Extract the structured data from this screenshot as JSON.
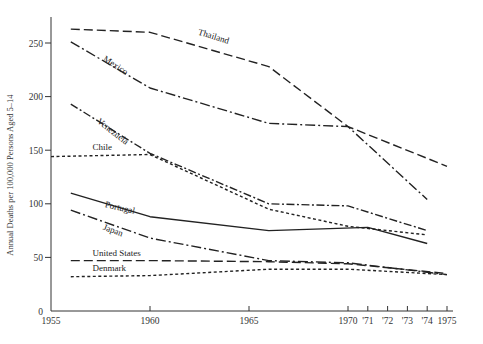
{
  "chart_data": {
    "type": "line",
    "title": "",
    "xlabel": "",
    "ylabel": "Annual Deaths per 100,000 Persons Aged 5–14",
    "xlim": [
      1955,
      1975
    ],
    "ylim": [
      0,
      270
    ],
    "grid": false,
    "legend": "inline labels",
    "x_ticks": [
      {
        "value": 1955,
        "label": "1955"
      },
      {
        "value": 1960,
        "label": "1960"
      },
      {
        "value": 1965,
        "label": "1965"
      },
      {
        "value": 1970,
        "label": "1970"
      },
      {
        "value": 1971,
        "label": "'71"
      },
      {
        "value": 1972,
        "label": "'72"
      },
      {
        "value": 1973,
        "label": "'73"
      },
      {
        "value": 1974,
        "label": "'74"
      },
      {
        "value": 1975,
        "label": "1975"
      }
    ],
    "y_ticks": [
      {
        "value": 0,
        "label": "0"
      },
      {
        "value": 50,
        "label": "50"
      },
      {
        "value": 100,
        "label": "100"
      },
      {
        "value": 150,
        "label": "150"
      },
      {
        "value": 200,
        "label": "200"
      },
      {
        "value": 250,
        "label": "250"
      }
    ],
    "series": [
      {
        "name": "Thailand",
        "style": "long-dash",
        "x": [
          1956,
          1960,
          1966,
          1970,
          1975
        ],
        "values": [
          263,
          260,
          228,
          172,
          135
        ],
        "label_pos": {
          "x": 1962.4,
          "y": 258,
          "angle": 17
        }
      },
      {
        "name": "Mexico",
        "style": "dash-dot",
        "x": [
          1956,
          1960,
          1966,
          1970,
          1974
        ],
        "values": [
          251,
          208,
          175,
          172,
          104
        ],
        "label_pos": {
          "x": 1957.6,
          "y": 234,
          "angle": 33
        }
      },
      {
        "name": "Venezuela",
        "style": "dash-dot-dense",
        "x": [
          1956,
          1960,
          1966,
          1970,
          1974
        ],
        "values": [
          193,
          147,
          100,
          98,
          75
        ],
        "label_pos": {
          "x": 1957.3,
          "y": 176,
          "angle": 38
        }
      },
      {
        "name": "Chile",
        "style": "short-dash",
        "x": [
          1955,
          1960,
          1966,
          1970,
          1974
        ],
        "values": [
          144,
          146,
          95,
          79,
          71
        ],
        "label_pos": {
          "x": 1957.1,
          "y": 150,
          "angle": 0
        }
      },
      {
        "name": "Portugal",
        "style": "solid",
        "x": [
          1956,
          1960,
          1966,
          1971,
          1974
        ],
        "values": [
          110,
          88,
          75,
          78,
          63
        ],
        "label_pos": {
          "x": 1957.7,
          "y": 97,
          "angle": 13
        }
      },
      {
        "name": "Japan",
        "style": "dash-dot",
        "x": [
          1956,
          1960,
          1966,
          1970,
          1975
        ],
        "values": [
          94,
          68,
          47,
          45,
          34
        ],
        "label_pos": {
          "x": 1957.6,
          "y": 76,
          "angle": 20
        }
      },
      {
        "name": "United States",
        "style": "long-dash",
        "x": [
          1956,
          1960,
          1966,
          1970,
          1975
        ],
        "values": [
          47,
          47,
          46,
          44,
          35
        ],
        "label_pos": {
          "x": 1957.1,
          "y": 51,
          "angle": 0
        }
      },
      {
        "name": "Denmark",
        "style": "short-dash",
        "x": [
          1956,
          1960,
          1966,
          1970,
          1975
        ],
        "values": [
          32,
          33,
          39,
          39,
          34
        ],
        "label_pos": {
          "x": 1957.1,
          "y": 37,
          "angle": 0
        }
      }
    ]
  }
}
